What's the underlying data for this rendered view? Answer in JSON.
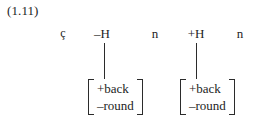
{
  "figure": {
    "example_number": "(1.11)",
    "segment_tier": [
      {
        "label": "ç",
        "x": 63,
        "small": true
      },
      {
        "label": "–H",
        "x": 102,
        "small": false
      },
      {
        "label": "n",
        "x": 155,
        "small": false
      },
      {
        "label": "+H",
        "x": 196,
        "small": false
      },
      {
        "label": "n",
        "x": 240,
        "small": false
      }
    ],
    "association_lines": [
      {
        "name": "assoc-line-left",
        "x": 104,
        "top": 43,
        "height": 36
      },
      {
        "name": "assoc-line-right",
        "x": 196,
        "top": 43,
        "height": 36
      }
    ],
    "matrices": [
      {
        "name": "feature-matrix-left",
        "x": 88,
        "y": 79,
        "features": [
          "+back",
          "–round"
        ]
      },
      {
        "name": "feature-matrix-right",
        "x": 180,
        "y": 79,
        "features": [
          "+back",
          "–round"
        ]
      }
    ]
  },
  "colors": {
    "ink": "#1d1d1d",
    "rule": "#2b2b2b",
    "background": "#ffffff"
  }
}
